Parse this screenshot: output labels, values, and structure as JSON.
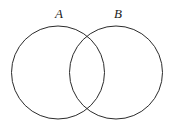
{
  "figure": {
    "type": "venn-diagram",
    "title": "",
    "background_color": "#ffffff",
    "stroke_color": "#2b2b2b",
    "label_color": "#1a1a1a",
    "stroke_width": 1,
    "width": 174,
    "height": 126
  },
  "sets": [
    {
      "id": "A",
      "label": "A",
      "label_x": 59,
      "label_y": 18,
      "center_x": 58,
      "center_y": 72.5,
      "radius": 46.5,
      "fill": "none"
    },
    {
      "id": "B",
      "label": "B",
      "label_x": 118,
      "label_y": 18,
      "center_x": 116,
      "center_y": 72.5,
      "radius": 46.5,
      "fill": "none"
    }
  ],
  "intersections": [
    {
      "name": "upper-crossing",
      "x": 87,
      "y": 32
    },
    {
      "name": "lower-crossing",
      "x": 87,
      "y": 113
    }
  ]
}
